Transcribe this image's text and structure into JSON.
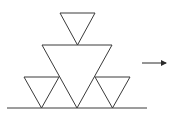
{
  "diagram": {
    "stroke_color": "#3a3a3a",
    "background": "#ffffff",
    "triangles": [
      {
        "name": "top-triangle",
        "points": "60,13 95,13 77.5,45"
      },
      {
        "name": "middle-triangle",
        "points": "42,45 112,45 77,108"
      },
      {
        "name": "left-small-triangle",
        "points": "24,77 59,77 41.5,108"
      },
      {
        "name": "right-small-triangle",
        "points": "95,77 130,77 112.5,108"
      }
    ],
    "ground_line": {
      "x1": 7,
      "y1": 108,
      "x2": 147,
      "y2": 108
    },
    "arrow": {
      "x1": 142,
      "y1": 63,
      "x2": 166,
      "y2": 63,
      "direction": "right"
    }
  }
}
